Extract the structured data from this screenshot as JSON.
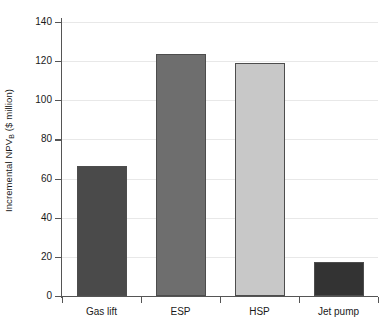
{
  "chart_data": {
    "type": "bar",
    "title": "",
    "xlabel": "",
    "ylabel": "Incremental NPV",
    "ylabel_subscript": "B",
    "ylabel_units": "($ million)",
    "ylabel_full": "Incremental NPVB ($ million)",
    "categories": [
      "Gas lift",
      "ESP",
      "HSP",
      "Jet pump"
    ],
    "values": [
      66.5,
      123.5,
      119,
      17.5
    ],
    "ylim": [
      0,
      140
    ],
    "ytick_labels": [
      "0",
      "20",
      "40",
      "60",
      "80",
      "100",
      "120",
      "140"
    ],
    "ytick_values": [
      0,
      20,
      40,
      60,
      80,
      100,
      120,
      140
    ],
    "grid": true,
    "legend": "none",
    "bar_colors": [
      "#4a4a4a",
      "#6e6e6e",
      "#c8c8c8",
      "#333333"
    ],
    "bar_edge_color": "#4d4d4d",
    "gridline_color": "#e8e8e8",
    "axis_color": "#555555",
    "background_color": "#ffffff"
  }
}
